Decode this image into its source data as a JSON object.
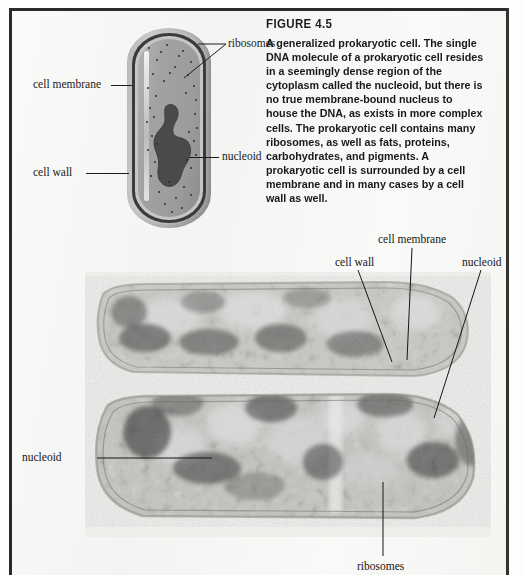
{
  "figure": {
    "heading": "FIGURE 4.5",
    "caption": "A generalized prokaryotic cell. The single DNA molecule of a prokaryotic cell resides in a seemingly dense region of the cytoplasm called the nucleoid, but there is no true membrane-bound nucleus to house the DNA, as exists in more complex cells. The prokaryotic cell contains many ribosomes, as well as fats, proteins, carbohydrates, and pigments. A prokaryotic cell is surrounded by a cell membrane and in many cases by a cell wall as well."
  },
  "diagram": {
    "labels": {
      "ribosomes": "ribosomes",
      "cell_membrane": "cell membrane",
      "cell_wall": "cell wall",
      "nucleoid": "nucleoid"
    }
  },
  "micrograph": {
    "labels": {
      "cell_membrane": "cell membrane",
      "cell_wall": "cell wall",
      "nucleoid_top": "nucleoid",
      "nucleoid_left": "nucleoid",
      "ribosomes": "ribosomes"
    }
  },
  "colors": {
    "page_background": "#f4f4f2",
    "frame": "#2a2a2a",
    "text": "#1a1a1a",
    "cell_wall": "#c6c6c6",
    "cell_membrane": "#3b3b3b",
    "cytoplasm": "#a2a2a2",
    "nucleoid": "#4a4a4a",
    "ribosome_dot": "#2f2f2f"
  }
}
